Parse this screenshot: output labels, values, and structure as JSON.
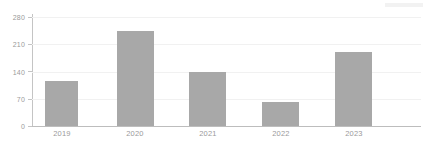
{
  "chart_data": {
    "type": "bar",
    "title": "",
    "subtitle": "",
    "xlabel": "",
    "ylabel": "",
    "categories": [
      "2019",
      "2020",
      "2021",
      "2022",
      "2023"
    ],
    "values": [
      115,
      245,
      140,
      62,
      190
    ],
    "series": [
      {
        "name": "Series 1",
        "values": [
          115,
          245,
          140,
          62,
          190
        ],
        "color": "#a8a8a8"
      }
    ],
    "ylim": [
      0,
      280
    ],
    "yticks": [
      0,
      70,
      140,
      210,
      280
    ],
    "ytick_labels": [
      "0",
      "70",
      "140",
      "210",
      "280"
    ],
    "xtick_labels": [
      "2019",
      "2020",
      "2021",
      "2022",
      "2023"
    ],
    "grid": true,
    "grid_axis": "y",
    "legend": false,
    "legend_position": "none"
  },
  "style": {
    "background": "#ffffff",
    "bar_color": "#a8a8a8",
    "gridline_color": "#f1f1f1",
    "axis_color": "#c4c4c4",
    "baseline_color": "#bdbdbd",
    "tick_label_color": "#9a9a9a"
  }
}
